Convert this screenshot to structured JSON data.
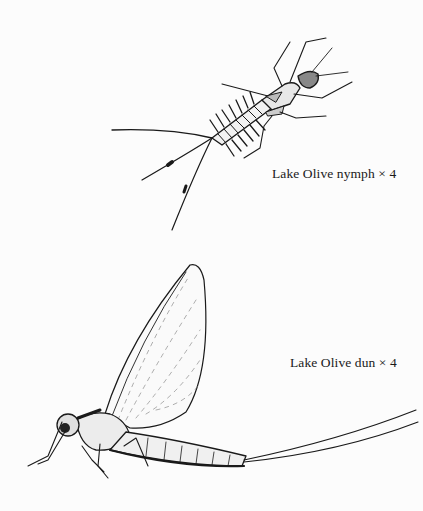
{
  "page": {
    "background": "#fcfcfc",
    "ink": "#1a1a1a"
  },
  "figures": [
    {
      "id": "nymph",
      "subject": "mayfly-nymph-illustration",
      "caption": "Lake Olive nymph  × 4"
    },
    {
      "id": "dun",
      "subject": "mayfly-dun-illustration",
      "caption": "Lake Olive dun  × 4"
    }
  ]
}
